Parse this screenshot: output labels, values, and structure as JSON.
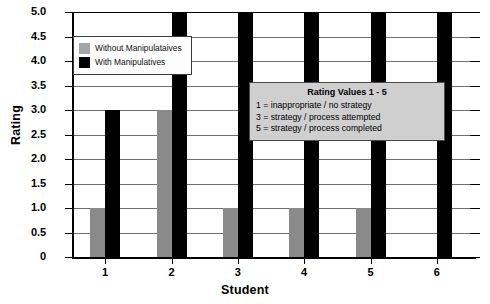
{
  "chart_data": {
    "type": "bar",
    "title": "",
    "xlabel": "Student",
    "ylabel": "Rating",
    "categories": [
      "1",
      "2",
      "3",
      "4",
      "5",
      "6"
    ],
    "series": [
      {
        "name": "Without Manipulataives",
        "color": "#8a8a8a",
        "values": [
          1,
          3,
          1,
          1,
          1,
          0
        ]
      },
      {
        "name": "With Manipulatives",
        "color": "#000000",
        "values": [
          3,
          5,
          5,
          5,
          5,
          5
        ]
      }
    ],
    "ylim": [
      0,
      5
    ],
    "ytick_labels": [
      "5.0",
      "4.5",
      "4.0",
      "3.5",
      "3.0",
      "2.5",
      "2.0",
      "1.5",
      "1.0",
      "0.5",
      "0"
    ],
    "ytick_values": [
      5,
      4.5,
      4,
      3.5,
      3,
      2.5,
      2,
      1.5,
      1,
      0.5,
      0
    ],
    "grid": true,
    "legend_position": "top-left"
  },
  "legend": {
    "items": [
      {
        "label": "Without Manipulataives",
        "swatch": "gray-swatch"
      },
      {
        "label": "With Manipulatives",
        "swatch": "black-swatch"
      }
    ]
  },
  "annotation": {
    "title": "Rating Values 1 - 5",
    "lines": [
      "1 = inappropriate / no strategy",
      "3 = strategy / process attempted",
      "5 = strategy / process completed"
    ]
  },
  "axes": {
    "x_title": "Student",
    "y_title": "Rating"
  },
  "colors": {
    "without_manipulatives": "#8a8a8a",
    "with_manipulatives": "#000000",
    "annotation_background": "#cfcfcf",
    "gridline": "#6f6f6f",
    "axis": "#000000"
  }
}
